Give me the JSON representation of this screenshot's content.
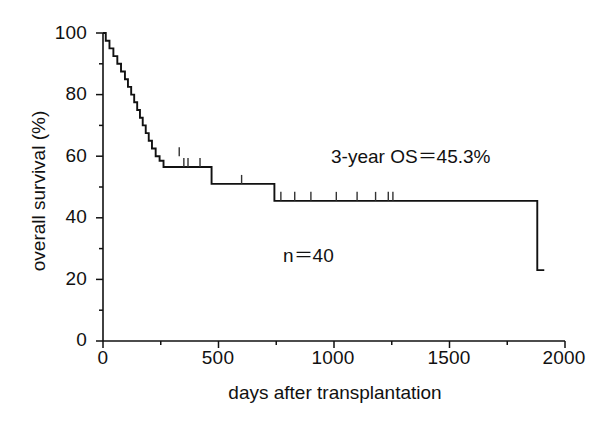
{
  "chart_data": {
    "type": "line",
    "subtype": "kaplan-meier-survival-curve",
    "title": "",
    "xlabel": "days after transplantation",
    "ylabel": "overall survival (%)",
    "xlim": [
      0,
      2000
    ],
    "ylim": [
      0,
      100
    ],
    "xticks": [
      0,
      500,
      1000,
      1500,
      2000
    ],
    "xtick_labels": [
      "0",
      "500",
      "1000",
      "1500",
      "2000"
    ],
    "xminor_ticks": [
      250,
      750,
      1250,
      1750
    ],
    "yticks": [
      0,
      20,
      40,
      60,
      80,
      100
    ],
    "ytick_labels": [
      "0",
      "20",
      "40",
      "60",
      "80",
      "100"
    ],
    "yminor_ticks": [
      10,
      30,
      50,
      70,
      90
    ],
    "grid": false,
    "legend": false,
    "line_color": "#111111",
    "series": [
      {
        "name": "overall survival",
        "step": "post",
        "x": [
          0,
          12,
          28,
          45,
          62,
          78,
          95,
          108,
          122,
          135,
          148,
          160,
          172,
          185,
          198,
          212,
          228,
          245,
          262,
          330,
          452,
          470,
          742,
          1870,
          1880
        ],
        "y": [
          100,
          97.5,
          95,
          92.5,
          90,
          87.5,
          85,
          82.5,
          80,
          77.5,
          75,
          72.5,
          70,
          67.5,
          65,
          62.5,
          60,
          58.5,
          56.5,
          56.5,
          56.5,
          51,
          45.5,
          45.5,
          23
        ]
      }
    ],
    "censor_marks": {
      "symbol": "vertical-tick",
      "points": [
        {
          "x": 330,
          "y": 60
        },
        {
          "x": 350,
          "y": 56.5
        },
        {
          "x": 368,
          "y": 56.5
        },
        {
          "x": 420,
          "y": 56.5
        },
        {
          "x": 600,
          "y": 51
        },
        {
          "x": 770,
          "y": 45.5
        },
        {
          "x": 830,
          "y": 45.5
        },
        {
          "x": 900,
          "y": 45.5
        },
        {
          "x": 1010,
          "y": 45.5
        },
        {
          "x": 1100,
          "y": 45.5
        },
        {
          "x": 1180,
          "y": 45.5
        },
        {
          "x": 1235,
          "y": 45.5
        },
        {
          "x": 1255,
          "y": 45.5
        }
      ]
    },
    "annotations": [
      {
        "name": "three-year-os",
        "text": "3-year OS＝45.3%",
        "x": 1450,
        "y": 70
      },
      {
        "name": "sample-size",
        "text": "n＝40",
        "x": 790,
        "y": 29
      }
    ]
  },
  "axes": {
    "y_label": "overall survival (%)",
    "x_label": "days after transplantation",
    "y_tick_labels": [
      "100",
      "80",
      "60",
      "40",
      "20",
      "0"
    ],
    "x_tick_labels": [
      "0",
      "500",
      "1000",
      "1500",
      "2000"
    ]
  },
  "annotations": {
    "os_text": "3-year OS＝45.3%",
    "n_text": "n＝40"
  }
}
